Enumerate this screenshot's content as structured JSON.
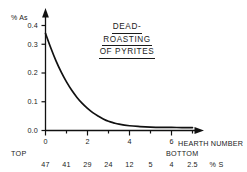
{
  "chart_data": {
    "type": "line",
    "title_lines": [
      "DEAD-",
      "ROASTING",
      "OF PYRITES"
    ],
    "xlabel": "HEARTH NUMBER",
    "ylabel": "% As",
    "xlim": [
      0,
      7.2
    ],
    "ylim": [
      0.0,
      0.43
    ],
    "grid": false,
    "legend": null,
    "x_ticks": [
      "0",
      "2",
      "4",
      "6"
    ],
    "x_tick_values": [
      0,
      2,
      4,
      6
    ],
    "x_minor_tick_values": [
      1,
      3,
      5,
      7
    ],
    "y_ticks": [
      "0.0",
      "0.1",
      "0.2",
      "0.3",
      "0.4"
    ],
    "y_tick_values": [
      0.0,
      0.1,
      0.2,
      0.3,
      0.4
    ],
    "x": [
      0,
      0.25,
      0.5,
      0.75,
      1.0,
      1.25,
      1.5,
      1.75,
      2.0,
      2.25,
      2.5,
      2.75,
      3.0,
      3.25,
      3.5,
      4.0,
      4.5,
      5.0,
      5.5,
      6.0,
      6.5,
      7.0
    ],
    "values": [
      0.37,
      0.315,
      0.265,
      0.222,
      0.185,
      0.153,
      0.126,
      0.103,
      0.084,
      0.068,
      0.055,
      0.044,
      0.035,
      0.029,
      0.024,
      0.018,
      0.015,
      0.013,
      0.012,
      0.012,
      0.011,
      0.011
    ],
    "secondary_axis": {
      "label": "% S",
      "tick_values": [
        0,
        1,
        2,
        3,
        4,
        5,
        6,
        7
      ],
      "tick_labels": [
        "47",
        "41",
        "29",
        "24",
        "12",
        "5",
        "4",
        "2.5"
      ],
      "start_label": "TOP",
      "end_label": "BOTTOM"
    },
    "line_color": "#111111",
    "axis_color": "#111111"
  },
  "axes": {
    "y_title": "% As",
    "x_title": "HEARTH NUMBER",
    "top_label": "TOP",
    "bottom_label": "BOTTOM",
    "sulfur_unit": "% S"
  }
}
